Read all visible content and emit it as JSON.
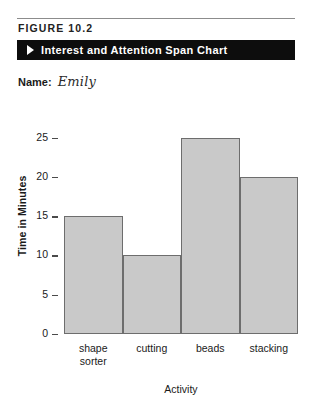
{
  "figure": {
    "number_label": "FIGURE 10.2",
    "banner_arrow_icon": "play-triangle-icon",
    "banner_title": "Interest and Attention Span Chart"
  },
  "form": {
    "name_label": "Name:",
    "name_value": "Emily"
  },
  "chart_data": {
    "type": "bar",
    "title": "Interest and Attention Span Chart",
    "categories": [
      "shape sorter",
      "cutting",
      "beads",
      "stacking"
    ],
    "values": [
      15,
      10,
      25,
      20
    ],
    "xlabel": "Activity",
    "ylabel": "Time in Minutes",
    "ylim": [
      0,
      27.5
    ],
    "yticks": [
      0,
      5,
      10,
      15,
      20,
      25
    ],
    "ytick_labels": [
      "0",
      "5",
      "10",
      "15",
      "20",
      "25"
    ],
    "grid": false,
    "legend": false,
    "bar_fill_color": "#c9c9c9",
    "bar_edge_color": "#6d6d6d",
    "bars_touching": true
  },
  "colors": {
    "banner_background": "#0d0d0d",
    "banner_text": "#ffffff",
    "page_background": "#ffffff",
    "rule": "#8c8c8c",
    "text": "#1a1a1a"
  }
}
